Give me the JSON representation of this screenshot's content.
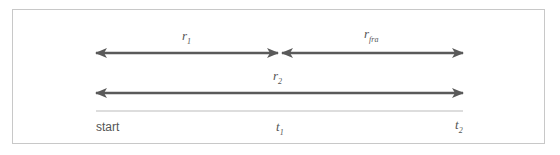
{
  "diagram": {
    "type": "timeline",
    "arrows": [
      {
        "label": "r",
        "sub": "1",
        "from": "start",
        "to": "t1"
      },
      {
        "label": "r",
        "sub": "fra",
        "from": "t1",
        "to": "t2"
      },
      {
        "label": "r",
        "sub": "2",
        "from": "start",
        "to": "t2"
      }
    ],
    "axis_labels": {
      "start": "start",
      "t1": {
        "label": "t",
        "sub": "1"
      },
      "t2": {
        "label": "t",
        "sub": "2"
      }
    },
    "colors": {
      "arrow": "#5a5a5a",
      "baseline": "#bbbbbb",
      "frame": "#c8c8c8",
      "text": "#555555"
    }
  }
}
